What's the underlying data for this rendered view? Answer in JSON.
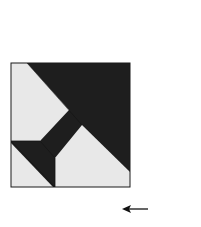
{
  "diagram": {
    "type": "quilt-block-assembly",
    "colors": {
      "dark": "#2e2e2e",
      "darker": "#1c1c1c",
      "light": "#e8e8e8",
      "outline": "#1a1a1a",
      "background": "#ffffff"
    },
    "left_unit": {
      "top_strip": {
        "rows": 3,
        "cells_per_row": [
          5,
          6,
          7
        ],
        "cell_size": 15,
        "pattern": "half-square triangles, dark lower-left / light upper-right"
      },
      "center_block": {
        "description": "large dark diagonal with light corners and dark bar"
      }
    },
    "right_strip": {
      "columns": 3,
      "rows": 11,
      "cell_size": 15,
      "pattern": "half-square triangles"
    },
    "arrow": {
      "direction": "left",
      "glyph": "←"
    }
  }
}
